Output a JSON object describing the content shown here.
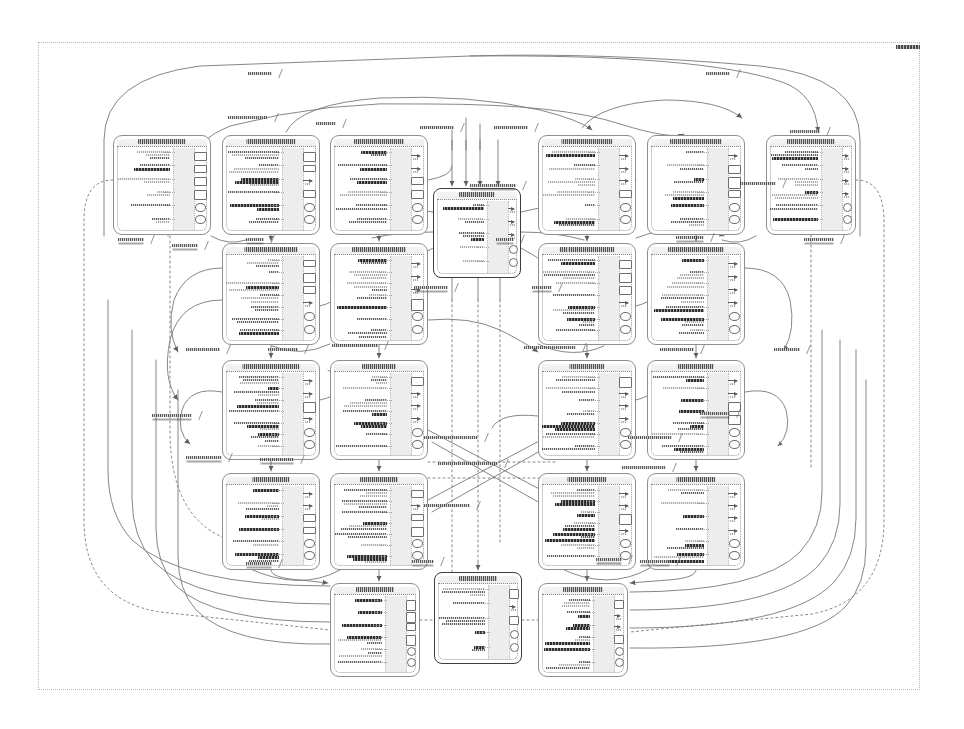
{
  "document": {
    "kind": "scanned-architecture-diagram",
    "title_tag": "diagram-corner-tag",
    "page_width": 964,
    "page_height": 729,
    "background_color": "#ffffff",
    "ink_color": "#333333",
    "node_border_color": "#8e8e8e",
    "node_header_fill": "#efefef",
    "edge_color": "#777777",
    "canvas_border": {
      "x": 38,
      "y": 42,
      "width": 882,
      "height": 648,
      "style": "dotted"
    },
    "legibility_note": "low-resolution scan; node and edge labels are not resolvable as glyphs"
  },
  "legend": {
    "node_shape": "rounded-rectangle",
    "node_header": "title band",
    "edge_shape": "orthogonal-and-curved-splines",
    "hub_node_style": "solid-dark-border"
  },
  "grid": {
    "rows": 4,
    "columns": 6,
    "left_block_columns": 3,
    "right_block_columns": 3,
    "row_tops": [
      135,
      243,
      360,
      473
    ],
    "row_height": 100,
    "left_column_lefts": [
      113,
      222,
      330
    ],
    "right_column_lefts": [
      538,
      647,
      766
    ],
    "node_width": 98
  },
  "nodes": [
    {
      "id": "n-r1c1",
      "name": "node-row1-col1",
      "x": 113,
      "y": 135,
      "w": 98,
      "h": 100,
      "style": "dashed",
      "rows": 6,
      "ports": 6
    },
    {
      "id": "n-r1c2",
      "name": "node-row1-col2",
      "x": 222,
      "y": 135,
      "w": 98,
      "h": 100,
      "style": "dashed",
      "rows": 6,
      "ports": 6
    },
    {
      "id": "n-r1c3",
      "name": "node-row1-col3",
      "x": 330,
      "y": 135,
      "w": 98,
      "h": 100,
      "style": "dashed",
      "rows": 6,
      "ports": 6
    },
    {
      "id": "n-r1c4",
      "name": "node-row1-col4",
      "x": 538,
      "y": 135,
      "w": 98,
      "h": 100,
      "style": "dashed",
      "rows": 6,
      "ports": 6
    },
    {
      "id": "n-r1c5",
      "name": "node-row1-col5",
      "x": 647,
      "y": 135,
      "w": 98,
      "h": 100,
      "style": "dashed",
      "rows": 6,
      "ports": 6
    },
    {
      "id": "n-r1c6",
      "name": "node-row1-col6",
      "x": 766,
      "y": 135,
      "w": 90,
      "h": 100,
      "style": "dashed",
      "rows": 6,
      "ports": 6
    },
    {
      "id": "n-r2c2",
      "name": "node-row2-col2",
      "x": 222,
      "y": 243,
      "w": 98,
      "h": 102,
      "style": "dashed",
      "rows": 7,
      "ports": 6
    },
    {
      "id": "n-r2c3",
      "name": "node-row2-col3",
      "x": 330,
      "y": 243,
      "w": 98,
      "h": 102,
      "style": "dashed",
      "rows": 7,
      "ports": 6
    },
    {
      "id": "n-r2c4",
      "name": "node-row2-col4",
      "x": 538,
      "y": 243,
      "w": 98,
      "h": 102,
      "style": "dashed",
      "rows": 7,
      "ports": 6
    },
    {
      "id": "n-r2c5",
      "name": "node-row2-col5",
      "x": 647,
      "y": 243,
      "w": 98,
      "h": 102,
      "style": "dashed",
      "rows": 7,
      "ports": 6
    },
    {
      "id": "n-r3c2",
      "name": "node-row3-col2",
      "x": 222,
      "y": 360,
      "w": 98,
      "h": 100,
      "style": "dashed",
      "rows": 7,
      "ports": 6
    },
    {
      "id": "n-r3c3",
      "name": "node-row3-col3",
      "x": 330,
      "y": 360,
      "w": 98,
      "h": 100,
      "style": "dashed",
      "rows": 7,
      "ports": 6
    },
    {
      "id": "n-r3c4",
      "name": "node-row3-col4",
      "x": 538,
      "y": 360,
      "w": 98,
      "h": 100,
      "style": "dashed",
      "rows": 7,
      "ports": 6
    },
    {
      "id": "n-r3c5",
      "name": "node-row3-col5",
      "x": 647,
      "y": 360,
      "w": 98,
      "h": 100,
      "style": "dashed",
      "rows": 7,
      "ports": 6
    },
    {
      "id": "n-r4c2",
      "name": "node-row4-col2",
      "x": 222,
      "y": 473,
      "w": 98,
      "h": 97,
      "style": "dashed",
      "rows": 6,
      "ports": 6
    },
    {
      "id": "n-r4c3",
      "name": "node-row4-col3",
      "x": 330,
      "y": 473,
      "w": 98,
      "h": 97,
      "style": "dashed",
      "rows": 7,
      "ports": 6
    },
    {
      "id": "n-r4c4",
      "name": "node-row4-col4",
      "x": 538,
      "y": 473,
      "w": 98,
      "h": 97,
      "style": "dashed",
      "rows": 7,
      "ports": 6
    },
    {
      "id": "n-r4c5",
      "name": "node-row4-col5",
      "x": 647,
      "y": 473,
      "w": 98,
      "h": 97,
      "style": "dashed",
      "rows": 6,
      "ports": 6
    },
    {
      "id": "n-hub",
      "name": "node-central-hub",
      "x": 433,
      "y": 188,
      "w": 88,
      "h": 90,
      "style": "solid",
      "rows": 5,
      "ports": 5
    },
    {
      "id": "n-b1",
      "name": "node-bottom-left",
      "x": 330,
      "y": 583,
      "w": 90,
      "h": 94,
      "style": "dashed",
      "rows": 6,
      "ports": 6
    },
    {
      "id": "n-b2",
      "name": "node-bottom-center",
      "x": 434,
      "y": 572,
      "w": 88,
      "h": 92,
      "style": "solid",
      "rows": 5,
      "ports": 5
    },
    {
      "id": "n-b3",
      "name": "node-bottom-right",
      "x": 538,
      "y": 583,
      "w": 90,
      "h": 94,
      "style": "dashed",
      "rows": 6,
      "ports": 6
    }
  ],
  "edge_labels": [
    {
      "name": "edge-label-top-arc",
      "x": 248,
      "y": 72,
      "w": 24
    },
    {
      "name": "edge-label-top-inner",
      "x": 228,
      "y": 116,
      "w": 40
    },
    {
      "name": "edge-label-top-mid",
      "x": 316,
      "y": 122,
      "w": 20
    },
    {
      "name": "edge-label-top-right-arc",
      "x": 706,
      "y": 72,
      "w": 24
    },
    {
      "name": "edge-label-tr-a",
      "x": 420,
      "y": 126,
      "w": 34
    },
    {
      "name": "edge-label-tr-b",
      "x": 494,
      "y": 126,
      "w": 34
    },
    {
      "name": "edge-label-r1",
      "x": 790,
      "y": 130,
      "w": 30
    },
    {
      "name": "edge-label-r2",
      "x": 740,
      "y": 182,
      "w": 36
    },
    {
      "name": "edge-label-r3",
      "x": 470,
      "y": 184,
      "w": 46
    },
    {
      "name": "edge-label-l1",
      "x": 118,
      "y": 238,
      "w": 26
    },
    {
      "name": "edge-label-l2",
      "x": 172,
      "y": 244,
      "w": 26
    },
    {
      "name": "edge-label-c1",
      "x": 246,
      "y": 238,
      "w": 18
    },
    {
      "name": "edge-label-c2",
      "x": 496,
      "y": 238,
      "w": 18
    },
    {
      "name": "edge-label-mid-left",
      "x": 414,
      "y": 286,
      "w": 34
    },
    {
      "name": "edge-label-mid-right",
      "x": 532,
      "y": 286,
      "w": 20
    },
    {
      "name": "edge-label-r4",
      "x": 676,
      "y": 236,
      "w": 28
    },
    {
      "name": "edge-label-r5",
      "x": 804,
      "y": 238,
      "w": 30
    },
    {
      "name": "edge-label-l3",
      "x": 186,
      "y": 348,
      "w": 34
    },
    {
      "name": "edge-label-c3",
      "x": 268,
      "y": 348,
      "w": 30
    },
    {
      "name": "edge-label-c4",
      "x": 332,
      "y": 344,
      "w": 46
    },
    {
      "name": "edge-label-c5",
      "x": 524,
      "y": 346,
      "w": 52
    },
    {
      "name": "edge-label-r6",
      "x": 660,
      "y": 348,
      "w": 34
    },
    {
      "name": "edge-label-r7",
      "x": 774,
      "y": 348,
      "w": 26
    },
    {
      "name": "edge-label-x1",
      "x": 424,
      "y": 436,
      "w": 54
    },
    {
      "name": "edge-label-x2",
      "x": 438,
      "y": 462,
      "w": 60
    },
    {
      "name": "edge-label-x3",
      "x": 424,
      "y": 504,
      "w": 46
    },
    {
      "name": "edge-label-x4",
      "x": 628,
      "y": 436,
      "w": 44
    },
    {
      "name": "edge-label-x5",
      "x": 622,
      "y": 466,
      "w": 44
    },
    {
      "name": "edge-label-l4",
      "x": 186,
      "y": 456,
      "w": 36
    },
    {
      "name": "edge-label-c6",
      "x": 260,
      "y": 458,
      "w": 34
    },
    {
      "name": "edge-label-b1",
      "x": 246,
      "y": 562,
      "w": 26
    },
    {
      "name": "edge-label-b2",
      "x": 412,
      "y": 560,
      "w": 22
    },
    {
      "name": "edge-label-b3",
      "x": 596,
      "y": 558,
      "w": 26
    },
    {
      "name": "edge-label-b4",
      "x": 640,
      "y": 560,
      "w": 30
    },
    {
      "name": "edge-label-l5",
      "x": 152,
      "y": 414,
      "w": 40
    },
    {
      "name": "edge-label-r8",
      "x": 700,
      "y": 412,
      "w": 30
    }
  ],
  "corner_tag": {
    "name": "sheet-corner-tag",
    "x": 896,
    "y": 45,
    "w": 24
  }
}
